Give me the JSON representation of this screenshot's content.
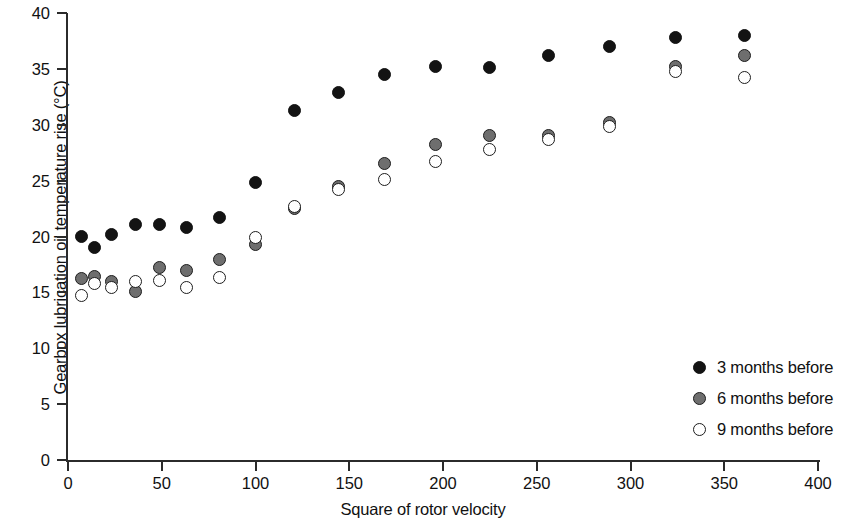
{
  "chart_data": {
    "type": "scatter",
    "title": "",
    "xlabel": "Square of rotor velocity",
    "ylabel": "Gearbox lubrication oil temperature rise (°C)",
    "xlim": [
      0,
      400
    ],
    "ylim": [
      0,
      40
    ],
    "xticks": [
      0,
      50,
      100,
      150,
      200,
      250,
      300,
      350,
      400
    ],
    "yticks": [
      0,
      5,
      10,
      15,
      20,
      25,
      30,
      35,
      40
    ],
    "xtick_labels": [
      "0",
      "50",
      "100",
      "150",
      "200",
      "250",
      "300",
      "350",
      "400"
    ],
    "ytick_labels": [
      "0",
      "5",
      "10",
      "15",
      "20",
      "25",
      "30",
      "35",
      "40"
    ],
    "grid": false,
    "legend_position": "right",
    "series": [
      {
        "name": "3 months before",
        "marker": "filled-circle",
        "color": "#131313",
        "points": [
          {
            "x": 7,
            "y": 20.0
          },
          {
            "x": 14,
            "y": 19.0
          },
          {
            "x": 23,
            "y": 20.2
          },
          {
            "x": 36,
            "y": 21.1
          },
          {
            "x": 49,
            "y": 21.1
          },
          {
            "x": 63,
            "y": 20.8
          },
          {
            "x": 81,
            "y": 21.7
          },
          {
            "x": 100,
            "y": 24.8
          },
          {
            "x": 121,
            "y": 31.3
          },
          {
            "x": 144,
            "y": 32.9
          },
          {
            "x": 169,
            "y": 34.5
          },
          {
            "x": 196,
            "y": 35.2
          },
          {
            "x": 225,
            "y": 35.1
          },
          {
            "x": 256,
            "y": 36.2
          },
          {
            "x": 289,
            "y": 37.0
          },
          {
            "x": 324,
            "y": 37.8
          },
          {
            "x": 361,
            "y": 38.0
          }
        ]
      },
      {
        "name": "6 months before",
        "marker": "gray-circle",
        "color": "#6e6e6e",
        "points": [
          {
            "x": 7,
            "y": 16.2
          },
          {
            "x": 14,
            "y": 16.4
          },
          {
            "x": 23,
            "y": 16.0
          },
          {
            "x": 36,
            "y": 15.1
          },
          {
            "x": 49,
            "y": 17.2
          },
          {
            "x": 63,
            "y": 17.0
          },
          {
            "x": 81,
            "y": 17.9
          },
          {
            "x": 100,
            "y": 19.3
          },
          {
            "x": 121,
            "y": 22.5
          },
          {
            "x": 144,
            "y": 24.5
          },
          {
            "x": 169,
            "y": 26.5
          },
          {
            "x": 196,
            "y": 28.2
          },
          {
            "x": 225,
            "y": 29.0
          },
          {
            "x": 256,
            "y": 29.0
          },
          {
            "x": 289,
            "y": 30.2
          },
          {
            "x": 324,
            "y": 35.2
          },
          {
            "x": 361,
            "y": 36.2
          }
        ]
      },
      {
        "name": "9 months before",
        "marker": "open-circle",
        "color": "#ffffff",
        "points": [
          {
            "x": 7,
            "y": 14.7
          },
          {
            "x": 14,
            "y": 15.8
          },
          {
            "x": 23,
            "y": 15.4
          },
          {
            "x": 36,
            "y": 16.0
          },
          {
            "x": 49,
            "y": 16.1
          },
          {
            "x": 63,
            "y": 15.4
          },
          {
            "x": 81,
            "y": 16.3
          },
          {
            "x": 100,
            "y": 19.9
          },
          {
            "x": 121,
            "y": 22.7
          },
          {
            "x": 144,
            "y": 24.2
          },
          {
            "x": 169,
            "y": 25.1
          },
          {
            "x": 196,
            "y": 26.7
          },
          {
            "x": 225,
            "y": 27.8
          },
          {
            "x": 256,
            "y": 28.7
          },
          {
            "x": 289,
            "y": 29.8
          },
          {
            "x": 324,
            "y": 34.8
          },
          {
            "x": 361,
            "y": 34.2
          }
        ]
      }
    ]
  },
  "legend": {
    "items": [
      {
        "label": "3 months before"
      },
      {
        "label": "6 months before"
      },
      {
        "label": "9 months before"
      }
    ]
  }
}
